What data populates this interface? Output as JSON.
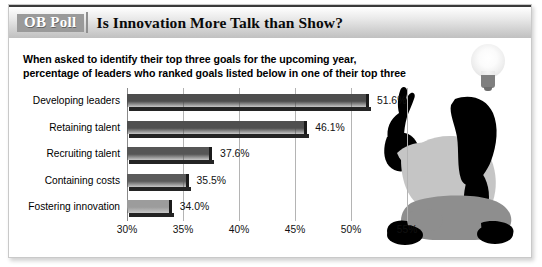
{
  "header": {
    "badge": "OB Poll",
    "title": "Is Innovation More Talk than Show?"
  },
  "subtitle": "When asked to identify their top three goals for the upcoming year, percentage of leaders who ranked goals listed below in one of their top three",
  "illustration": {
    "bulb_icon": "lightbulb-icon",
    "figure_icon": "seated-person-pointing-icon"
  },
  "chart_data": {
    "type": "bar",
    "orientation": "horizontal",
    "title": "Is Innovation More Talk than Show?",
    "subtitle": "When asked to identify their top three goals for the upcoming year, percentage of leaders who ranked goals listed below in one of their top three",
    "xlabel": "",
    "ylabel": "",
    "categories": [
      "Developing leaders",
      "Retaining talent",
      "Recruiting talent",
      "Containing costs",
      "Fostering innovation"
    ],
    "values": [
      51.6,
      46.1,
      37.6,
      35.5,
      34.0
    ],
    "value_labels": [
      "51.6%",
      "46.1%",
      "37.6%",
      "35.5%",
      "34.0%"
    ],
    "xlim": [
      30,
      55
    ],
    "xticks": [
      30,
      35,
      40,
      45,
      50,
      55
    ],
    "xtick_labels": [
      "30%",
      "35%",
      "40%",
      "45%",
      "50%",
      "55%"
    ],
    "bar_colors": [
      "#4d4d4d",
      "#4f4f4f",
      "#565656",
      "#5b5b5b",
      "#9c9c9c"
    ],
    "grid": true,
    "legend": false
  },
  "colors": {
    "badge_bg": "#9a9a9a",
    "header_text": "#0a0a0a",
    "gridline": "#b4b4b4",
    "frame": "#c9c9c9"
  }
}
